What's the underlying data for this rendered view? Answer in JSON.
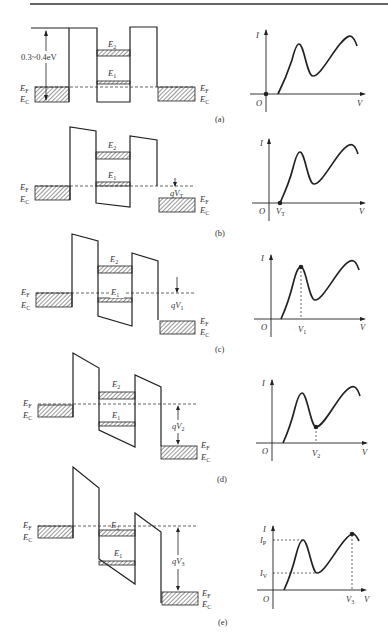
{
  "figure": {
    "top_rule": true,
    "energy_gap_label": "0.3~0.4eV",
    "labels": {
      "fermi": "E",
      "fermi_sub": "F",
      "conduction": "E",
      "conduction_sub": "C",
      "level2": "E",
      "level2_sub": "2",
      "level1": "E",
      "level1_sub": "1",
      "current_axis": "I",
      "voltage_axis": "V",
      "origin": "O",
      "peak_current": "I",
      "peak_current_sub": "P",
      "valley_current": "I",
      "valley_current_sub": "V"
    },
    "panels": [
      {
        "id": "a",
        "caption": "(a)",
        "bias_label": "",
        "bias_sub": "",
        "marker": "origin"
      },
      {
        "id": "b",
        "caption": "(b)",
        "bias_label": "qV",
        "bias_sub": "T",
        "voltage_tick": "V",
        "voltage_tick_sub": "T",
        "marker": "threshold"
      },
      {
        "id": "c",
        "caption": "(c)",
        "bias_label": "qV",
        "bias_sub": "1",
        "voltage_tick": "V",
        "voltage_tick_sub": "1",
        "marker": "peak"
      },
      {
        "id": "d",
        "caption": "(d)",
        "bias_label": "qV",
        "bias_sub": "2",
        "voltage_tick": "V",
        "voltage_tick_sub": "2",
        "marker": "valley"
      },
      {
        "id": "e",
        "caption": "(e)",
        "bias_label": "qV",
        "bias_sub": "3",
        "voltage_tick": "V",
        "voltage_tick_sub": "3",
        "marker": "second-peak"
      }
    ]
  }
}
